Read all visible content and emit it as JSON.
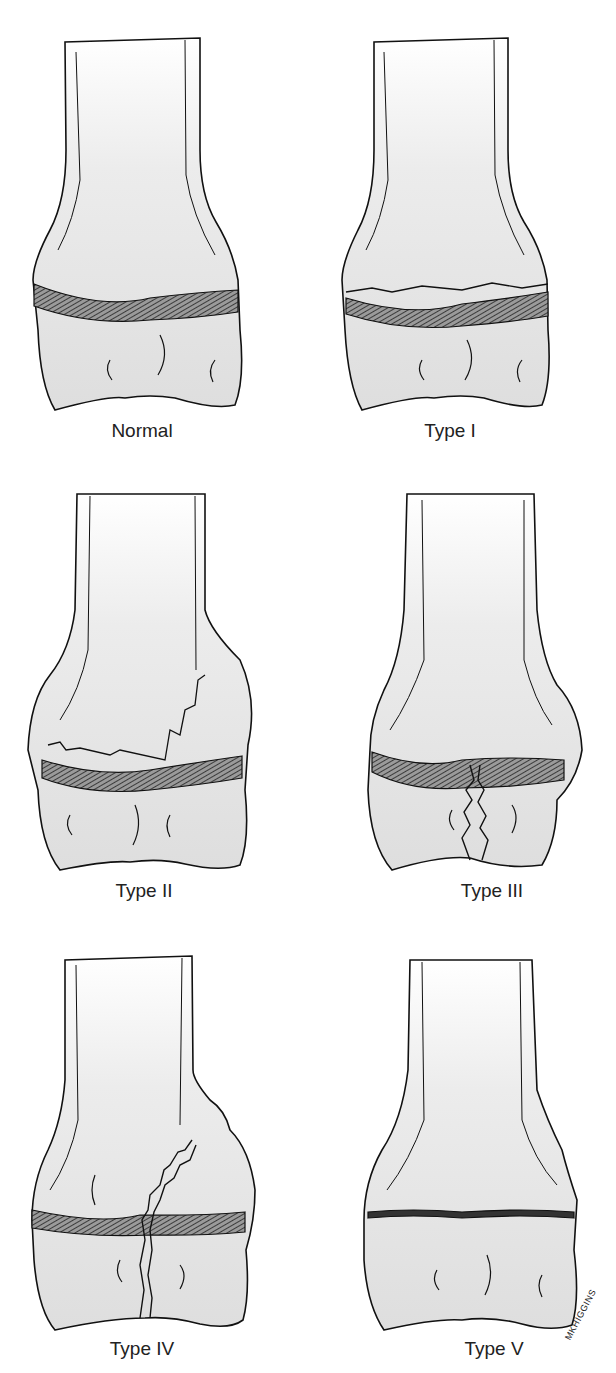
{
  "figure": {
    "panels": [
      {
        "id": "normal",
        "label": "Normal"
      },
      {
        "id": "type1",
        "label": "Type I"
      },
      {
        "id": "type2",
        "label": "Type II"
      },
      {
        "id": "type3",
        "label": "Type III"
      },
      {
        "id": "type4",
        "label": "Type IV"
      },
      {
        "id": "type5",
        "label": "Type V"
      }
    ],
    "signature": "MKHIGGINS",
    "colors": {
      "bone_fill": "#e4e4e4",
      "outline": "#111111",
      "physis": "#555555",
      "background": "#ffffff"
    }
  }
}
